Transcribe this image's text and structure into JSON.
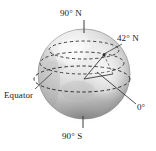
{
  "figure": {
    "background_color": "#ffffff",
    "globe": {
      "center_x": 84,
      "center_y": 74,
      "radius_x": 46,
      "radius_y": 45,
      "fill_light": "#f2f2f2",
      "fill_mid": "#c9c9c9",
      "fill_dark": "#9a9a9a",
      "outline_color": "#8a8a8a"
    },
    "axis": {
      "color": "#3a3a3a",
      "north_tip_y": 20,
      "south_tip_y": 128
    },
    "latitude_lines": {
      "style": "dashed",
      "color": "#2e2e2e",
      "circles": [
        {
          "name": "latitude-42n",
          "cy": 50,
          "rx": 36,
          "ry": 9
        },
        {
          "name": "latitude-mid",
          "cy": 62,
          "rx": 43,
          "ry": 11
        },
        {
          "name": "equator",
          "cy": 79,
          "rx": 48,
          "ry": 13
        }
      ]
    },
    "angle_wedge": {
      "name": "central-angle-42-degrees",
      "vertex_x": 84,
      "vertex_y": 79,
      "color": "#3a3a3a",
      "measure": "42"
    },
    "leaders": {
      "color": "#3a3a3a"
    }
  },
  "labels": {
    "north_pole": {
      "text": "90",
      "degree": "°",
      "suffix": " N",
      "full": "90° N"
    },
    "latitude_42": {
      "text": "42",
      "degree": "°",
      "suffix": " N",
      "full": "42° N"
    },
    "equator": {
      "text": "Equator",
      "full": "Equator"
    },
    "prime_meridian": {
      "text": "0",
      "degree": "°",
      "suffix": "",
      "full": "0°"
    },
    "south_pole": {
      "text": "90",
      "degree": "°",
      "suffix": " S",
      "full": "90° S"
    }
  }
}
